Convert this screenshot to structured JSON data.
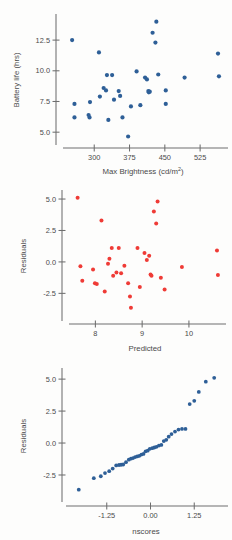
{
  "figure": {
    "panel_count": 3,
    "background_color": "#fdfdfc",
    "blue_color": "#2e5f97",
    "red_color": "#ef3b36",
    "axis_color": "#6e6e6e",
    "text_color": "#4a4a4a"
  },
  "chart_data": [
    {
      "type": "scatter",
      "title": "",
      "xlabel": "Max Brightness (cd/m",
      "xlabel_super": "2",
      "xlabel_tail": ")",
      "xlabel_full": "Max Brightness (cd/m2)",
      "ylabel": "Battery life (hrs)",
      "xticks": [
        300,
        375,
        450,
        525
      ],
      "xticklabels": [
        "300",
        "375",
        "450",
        "525"
      ],
      "yticks": [
        5.0,
        7.5,
        10.0,
        12.5
      ],
      "yticklabels": [
        "5.0",
        "7.5",
        "10.0",
        "12.5"
      ],
      "xlim": [
        240,
        580
      ],
      "ylim": [
        4.2,
        14.3
      ],
      "grid": false,
      "legend": "none",
      "marker_color": "#2e5f97",
      "points": [
        [
          253,
          12.5
        ],
        [
          258,
          7.3
        ],
        [
          258,
          6.2
        ],
        [
          288,
          6.4
        ],
        [
          290,
          6.2
        ],
        [
          291,
          7.45
        ],
        [
          310,
          11.5
        ],
        [
          312,
          7.9
        ],
        [
          320,
          8.6
        ],
        [
          325,
          8.4
        ],
        [
          327,
          9.65
        ],
        [
          330,
          6.0
        ],
        [
          338,
          9.65
        ],
        [
          342,
          7.65
        ],
        [
          352,
          8.35
        ],
        [
          355,
          7.95
        ],
        [
          360,
          6.2
        ],
        [
          372,
          4.65
        ],
        [
          378,
          7.1
        ],
        [
          390,
          9.95
        ],
        [
          398,
          7.2
        ],
        [
          408,
          9.45
        ],
        [
          412,
          9.3
        ],
        [
          415,
          8.35
        ],
        [
          416,
          8.25
        ],
        [
          418,
          8.3
        ],
        [
          424,
          13.1
        ],
        [
          430,
          12.3
        ],
        [
          432,
          14.0
        ],
        [
          436,
          9.7
        ],
        [
          452,
          8.4
        ],
        [
          452,
          7.3
        ],
        [
          492,
          9.45
        ],
        [
          563,
          11.4
        ],
        [
          565,
          9.55
        ]
      ]
    },
    {
      "type": "scatter",
      "title": "",
      "xlabel": "Predicted",
      "ylabel": "Residuals",
      "xticks": [
        8,
        9,
        10
      ],
      "xticklabels": [
        "8",
        "9",
        "10"
      ],
      "yticks": [
        -2.5,
        0.0,
        2.5,
        5.0
      ],
      "yticklabels": [
        "-2.5",
        "0.0",
        "2.5",
        "5.0"
      ],
      "xlim": [
        7.5,
        10.75
      ],
      "ylim": [
        -4.3,
        5.4
      ],
      "grid": false,
      "legend": "none",
      "marker_color": "#ef3b36",
      "points": [
        [
          7.62,
          5.1
        ],
        [
          7.68,
          -0.35
        ],
        [
          7.72,
          -1.5
        ],
        [
          7.95,
          -0.6
        ],
        [
          7.99,
          -1.7
        ],
        [
          8.03,
          -1.75
        ],
        [
          8.13,
          3.3
        ],
        [
          8.2,
          -2.35
        ],
        [
          8.27,
          -0.15
        ],
        [
          8.3,
          0.25
        ],
        [
          8.35,
          1.1
        ],
        [
          8.38,
          -1.1
        ],
        [
          8.45,
          -0.85
        ],
        [
          8.5,
          1.1
        ],
        [
          8.55,
          -0.9
        ],
        [
          8.62,
          -0.3
        ],
        [
          8.7,
          -1.7
        ],
        [
          8.74,
          -2.75
        ],
        [
          8.76,
          -3.65
        ],
        [
          8.9,
          1.1
        ],
        [
          8.95,
          -2.0
        ],
        [
          9.05,
          0.7
        ],
        [
          9.1,
          0.15
        ],
        [
          9.15,
          0.5
        ],
        [
          9.18,
          -1.0
        ],
        [
          9.2,
          -1.1
        ],
        [
          9.25,
          4.0
        ],
        [
          9.3,
          3.05
        ],
        [
          9.33,
          4.8
        ],
        [
          9.4,
          -1.25
        ],
        [
          9.48,
          -2.2
        ],
        [
          9.85,
          -0.4
        ],
        [
          10.6,
          0.9
        ],
        [
          10.62,
          -1.05
        ]
      ]
    },
    {
      "type": "scatter",
      "title": "",
      "xlabel": "nscores",
      "ylabel": "Residuals",
      "xticks": [
        -1.25,
        0.0,
        1.25
      ],
      "xticklabels": [
        "-1.25",
        "0.00",
        "1.25"
      ],
      "yticks": [
        -2.5,
        0.0,
        2.5,
        5.0
      ],
      "yticklabels": [
        "-2.5",
        "0.0",
        "2.5",
        "5.0"
      ],
      "xlim": [
        -2.3,
        2.1
      ],
      "ylim": [
        -4.3,
        5.4
      ],
      "grid": false,
      "legend": "none",
      "marker_color": "#2e5f97",
      "points": [
        [
          -2.05,
          -3.65
        ],
        [
          -1.62,
          -2.75
        ],
        [
          -1.42,
          -2.6
        ],
        [
          -1.3,
          -2.35
        ],
        [
          -1.18,
          -2.2
        ],
        [
          -1.08,
          -2.0
        ],
        [
          -0.98,
          -1.75
        ],
        [
          -0.9,
          -1.72
        ],
        [
          -0.84,
          -1.7
        ],
        [
          -0.78,
          -1.68
        ],
        [
          -0.7,
          -1.5
        ],
        [
          -0.62,
          -1.3
        ],
        [
          -0.56,
          -1.22
        ],
        [
          -0.5,
          -1.18
        ],
        [
          -0.44,
          -1.1
        ],
        [
          -0.38,
          -1.05
        ],
        [
          -0.32,
          -1.0
        ],
        [
          -0.26,
          -0.9
        ],
        [
          -0.2,
          -0.85
        ],
        [
          -0.14,
          -0.65
        ],
        [
          -0.08,
          -0.6
        ],
        [
          -0.02,
          -0.45
        ],
        [
          0.05,
          -0.4
        ],
        [
          0.11,
          -0.35
        ],
        [
          0.17,
          -0.3
        ],
        [
          0.24,
          -0.2
        ],
        [
          0.31,
          -0.15
        ],
        [
          0.38,
          0.15
        ],
        [
          0.45,
          0.25
        ],
        [
          0.52,
          0.5
        ],
        [
          0.6,
          0.7
        ],
        [
          0.7,
          0.9
        ],
        [
          0.8,
          1.05
        ],
        [
          0.9,
          1.1
        ],
        [
          1.0,
          1.1
        ],
        [
          1.12,
          3.05
        ],
        [
          1.25,
          3.3
        ],
        [
          1.38,
          4.0
        ],
        [
          1.58,
          4.8
        ],
        [
          1.82,
          5.1
        ]
      ]
    }
  ]
}
